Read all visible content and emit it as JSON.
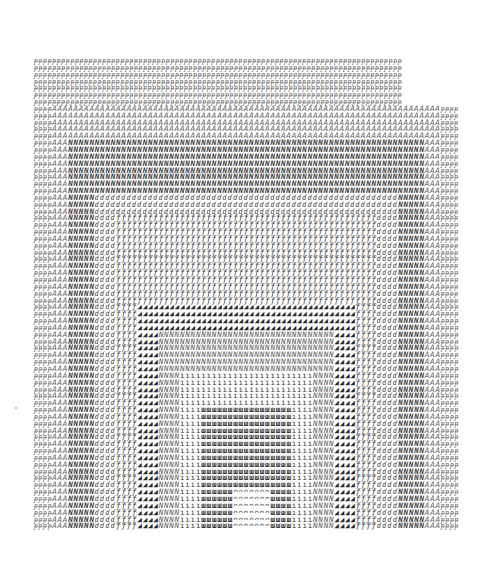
{
  "artwork": {
    "cols": 81,
    "rows": 69,
    "layers": [
      {
        "glyph": "ᵽ",
        "c0": 0,
        "c1": 80,
        "r0": 0,
        "r1": 68
      },
      {
        "glyph": "A",
        "c0": 4,
        "c1": 76,
        "r0": 7,
        "r1": 68
      },
      {
        "glyph": "N",
        "c0": 7,
        "c1": 73,
        "r0": 12,
        "r1": 68
      },
      {
        "glyph": "ɗ",
        "c0": 12,
        "c1": 68,
        "r0": 20,
        "r1": 68
      },
      {
        "glyph": "ƒ",
        "c0": 16,
        "c1": 64,
        "r0": 23,
        "r1": 68
      },
      {
        "glyph": "◢",
        "c0": 20,
        "c1": 60,
        "r0": 36,
        "r1": 68
      },
      {
        "glyph": "N",
        "c0": 24,
        "c1": 56,
        "r0": 40,
        "r1": 68
      },
      {
        "glyph": "ı",
        "c0": 28,
        "c1": 52,
        "r0": 46,
        "r1": 68
      },
      {
        "glyph": "ш",
        "c0": 32,
        "c1": 48,
        "r0": 51,
        "r1": 68
      },
      {
        "glyph": "ᴖ",
        "c0": 38,
        "c1": 44,
        "r0": 63,
        "r1": 68
      }
    ]
  }
}
